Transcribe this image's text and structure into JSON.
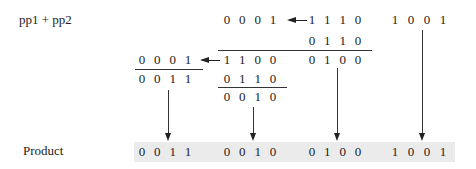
{
  "labels": {
    "top_label": "pp1 + pp2",
    "product_label": "Product"
  },
  "rows": {
    "r1_carry": [
      "0",
      "0",
      "0",
      "1"
    ],
    "r1_pp1": [
      "1",
      "1",
      "1",
      "0"
    ],
    "r1_low": [
      "1",
      "0",
      "0",
      "1"
    ],
    "r2_pp2": [
      "0",
      "1",
      "1",
      "0"
    ],
    "r3_carry": [
      "0",
      "0",
      "0",
      "1"
    ],
    "r3_sum_hi": [
      "1",
      "1",
      "0",
      "0"
    ],
    "r3_sum_lo": [
      "0",
      "1",
      "0",
      "0"
    ],
    "r4_sum": [
      "0",
      "0",
      "1",
      "1"
    ],
    "r4_add": [
      "0",
      "1",
      "1",
      "0"
    ],
    "r5_sum": [
      "0",
      "0",
      "1",
      "0"
    ]
  },
  "product": {
    "groups": [
      [
        "0",
        "0",
        "1",
        "1"
      ],
      [
        "0",
        "0",
        "1",
        "0"
      ],
      [
        "0",
        "1",
        "0",
        "0"
      ],
      [
        "1",
        "0",
        "0",
        "1"
      ]
    ]
  },
  "colors": {
    "band": "#ebebeb",
    "ink": "#222222"
  }
}
